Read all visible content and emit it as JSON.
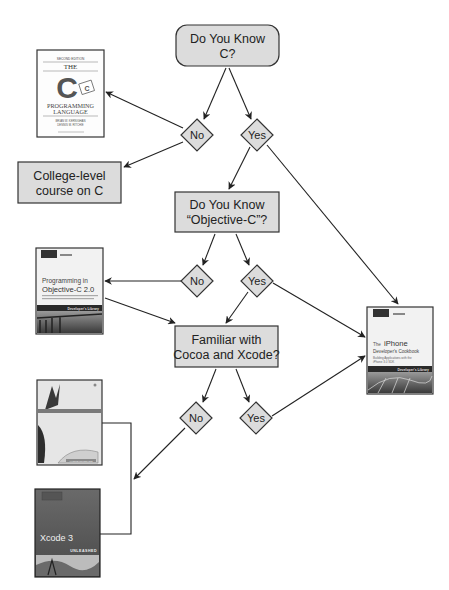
{
  "diagram": {
    "type": "flowchart",
    "colors": {
      "box_fill": "#dcdcdc",
      "stroke": "#333333",
      "background": "#ffffff"
    },
    "nodes": {
      "know_c": {
        "line1": "Do You Know",
        "line2": "C?"
      },
      "know_c_no": {
        "label": "No"
      },
      "know_c_yes": {
        "label": "Yes"
      },
      "college_course": {
        "line1": "College-level",
        "line2": "course on C"
      },
      "know_objc": {
        "line1": "Do You Know",
        "line2": "“Objective-C”?"
      },
      "know_objc_no": {
        "label": "No"
      },
      "know_objc_yes": {
        "label": "Yes"
      },
      "familiar_cocoa": {
        "line1": "Familiar with",
        "line2": "Cocoa and Xcode?"
      },
      "familiar_no": {
        "label": "No"
      },
      "familiar_yes": {
        "label": "Yes"
      }
    },
    "books": {
      "c_book": {
        "edition": "SECOND EDITION",
        "title_top": "THE",
        "title_letter": "C",
        "title_line1": "PROGRAMMING",
        "title_line2": "LANGUAGE",
        "authors_line1": "BRIAN W. KERNIGHAN",
        "authors_line2": "DENNIS M. RITCHIE"
      },
      "objc_book": {
        "title_line1": "Programming in",
        "title_line2": "Objective-C 2.0",
        "series": "Developer's Library"
      },
      "iphone_book": {
        "title_prefix": "The",
        "title_main": "iPhone",
        "title_line2": "Developer's Cookbook",
        "subtitle_line1": "Building Applications with the",
        "subtitle_line2": "iPhone 3.0 SDK",
        "series": "Developer's Library"
      },
      "cocoa_book": {
        "author": "AARON HILLEGASS"
      },
      "xcode_book": {
        "title": "Xcode 3",
        "badge": "UNLEASHED"
      }
    }
  }
}
